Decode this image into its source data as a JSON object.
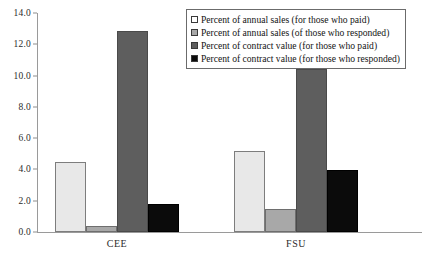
{
  "chart_data": {
    "type": "bar",
    "title": "",
    "xlabel": "",
    "ylabel": "",
    "categories": [
      "CEE",
      "FSU"
    ],
    "series": [
      {
        "name": "Percent of annual sales (for those who paid)",
        "color": "#e8e8e8",
        "values": [
          4.45,
          5.15
        ]
      },
      {
        "name": "Percent of annual sales (of those who responded)",
        "color": "#a8a8a8",
        "values": [
          0.4,
          1.5
        ]
      },
      {
        "name": "Percent of contract value (for those who paid)",
        "color": "#5e5e5e",
        "values": [
          12.85,
          10.4
        ]
      },
      {
        "name": "Percent of contract value (for those who responded)",
        "color": "#0b0b0b",
        "values": [
          1.8,
          3.95
        ]
      }
    ],
    "ylim": [
      0.0,
      14.0
    ],
    "ytick_step": 2.0,
    "yticks": [
      "14.0",
      "12.0",
      "10.0",
      "8.0",
      "6.0",
      "4.0",
      "2.0",
      "0.0"
    ],
    "ytick_values": [
      14.0,
      12.0,
      10.0,
      8.0,
      6.0,
      4.0,
      2.0,
      0.0
    ],
    "grid": false,
    "legend_position": "top-right"
  }
}
